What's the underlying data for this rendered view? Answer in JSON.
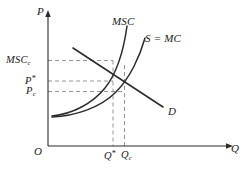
{
  "figure": {
    "type": "economics-externality-diagram",
    "background_color": "#ffffff",
    "line_color": "#2b2b2b",
    "dashed_color": "#7d7d7d",
    "axes": {
      "y_axis_label": "P",
      "x_axis_label": "Q",
      "origin_label": "O"
    },
    "curves": [
      {
        "id": "msc",
        "label": "MSC",
        "label_x": 112,
        "label_y": 16
      },
      {
        "id": "smc",
        "label": "S = MC",
        "label_x": 145,
        "label_y": 33
      },
      {
        "id": "demand",
        "label": "D",
        "label_x": 168,
        "label_y": 106
      }
    ],
    "price_ticks": [
      {
        "id": "msc_c",
        "base": "MSC",
        "sub": "c",
        "sup": "",
        "x": 6,
        "y": 55,
        "line_y": 60.5
      },
      {
        "id": "p_star",
        "base": "P",
        "sub": "",
        "sup": "*",
        "x": 25,
        "y": 75,
        "line_y": 81
      },
      {
        "id": "p_c",
        "base": "P",
        "sub": "c",
        "sup": "",
        "x": 26,
        "y": 86,
        "line_y": 91.5
      }
    ],
    "quantity_ticks": [
      {
        "id": "q_star",
        "base": "Q",
        "sub": "",
        "sup": "*",
        "x": 104,
        "y": 150,
        "line_x": 113
      },
      {
        "id": "q_c",
        "base": "Q",
        "sub": "c",
        "sup": "",
        "x": 121,
        "y": 150,
        "line_x": 124.5
      }
    ],
    "equilibria": [
      {
        "id": "social-optimum",
        "x": 113,
        "y": 81,
        "price_ref": "P*",
        "quantity_ref": "Q*"
      },
      {
        "id": "market-equilibrium",
        "x": 124.5,
        "y": 91.5,
        "price_ref": "Pc",
        "quantity_ref": "Qc"
      }
    ]
  }
}
